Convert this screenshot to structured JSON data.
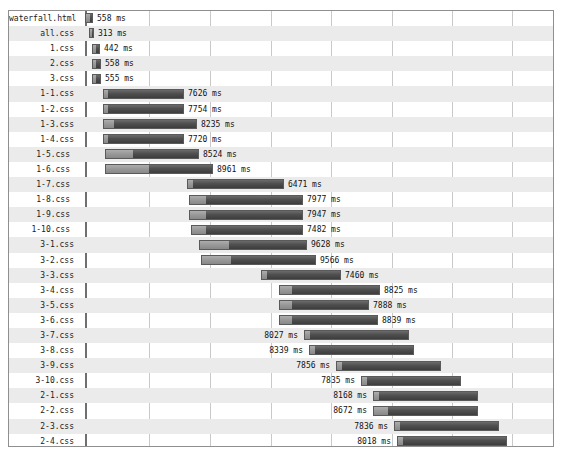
{
  "chart_data": {
    "type": "bar",
    "title": "",
    "subtitle": "",
    "xlabel": "",
    "ylabel": "",
    "orientation": "horizontal",
    "style": "waterfall-timeline",
    "unit": "ms",
    "grid": true,
    "legend": null,
    "xlim": [
      0,
      10000
    ],
    "axis_start_px": 76,
    "axis_end_px": 547,
    "gridlines_px": [
      76,
      140,
      201,
      262,
      322,
      383,
      443,
      503,
      547
    ],
    "categories": [
      "waterfall.html",
      "all.css",
      "1.css",
      "2.css",
      "3.css",
      "1-1.css",
      "1-2.css",
      "1-3.css",
      "1-4.css",
      "1-5.css",
      "1-6.css",
      "1-7.css",
      "1-8.css",
      "1-9.css",
      "1-10.css",
      "3-1.css",
      "3-2.css",
      "3-3.css",
      "3-4.css",
      "3-5.css",
      "3-6.css",
      "3-7.css",
      "3-8.css",
      "3-9.css",
      "3-10.css",
      "2-1.css",
      "2-2.css",
      "2-3.css",
      "2-4.css",
      "2-5.css",
      "2-6.css",
      "2-7.css",
      "2-8.css",
      "2-9.css",
      "2-10.css"
    ],
    "values": [
      558,
      313,
      442,
      558,
      555,
      7626,
      7754,
      8235,
      7720,
      8524,
      8961,
      6471,
      7977,
      7947,
      7482,
      9628,
      9566,
      7460,
      8825,
      7888,
      8839,
      8027,
      8339,
      7856,
      7835,
      8168,
      8672,
      7836,
      8018,
      7765,
      7938,
      7478,
      7391,
      6798,
      6080
    ],
    "value_labels": [
      "558 ms",
      "313 ms",
      "442 ms",
      "558 ms",
      "555 ms",
      "7626 ms",
      "7754 ms",
      "8235 ms",
      "7720 ms",
      "8524 ms",
      "8961 ms",
      "6471 ms",
      "7977 ms",
      "7947 ms",
      "7482 ms",
      "9628 ms",
      "9566 ms",
      "7460 ms",
      "8825 ms",
      "7888 ms",
      "8839 ms",
      "8027 ms",
      "8339 ms",
      "7856 ms",
      "7835 ms",
      "8168 ms",
      "8672 ms",
      "7836 ms",
      "8018 ms",
      "7765 ms",
      "7938 ms",
      "7478 ms",
      "7391 ms",
      "6798 ms",
      "6080 ms"
    ]
  },
  "rows": [
    {
      "label": "waterfall.html",
      "value": "558 ms",
      "start": 76,
      "wait": 4,
      "width": 8,
      "label_side": "after",
      "indent": false
    },
    {
      "label": "all.css",
      "value": "313 ms",
      "start": 80,
      "wait": 2,
      "width": 5,
      "label_side": "after",
      "indent": false
    },
    {
      "label": "1.css",
      "value": "442 ms",
      "start": 83,
      "wait": 3,
      "width": 8,
      "label_side": "after",
      "indent": false
    },
    {
      "label": "2.css",
      "value": "558 ms",
      "start": 83,
      "wait": 3,
      "width": 9,
      "label_side": "after",
      "indent": false
    },
    {
      "label": "3.css",
      "value": "555 ms",
      "start": 83,
      "wait": 3,
      "width": 9,
      "label_side": "after",
      "indent": false
    },
    {
      "label": "1-1.css",
      "value": "7626 ms",
      "start": 94,
      "wait": 4,
      "width": 81,
      "label_side": "after",
      "indent": false
    },
    {
      "label": "1-2.css",
      "value": "7754 ms",
      "start": 94,
      "wait": 4,
      "width": 81,
      "label_side": "after",
      "indent": false
    },
    {
      "label": "1-3.css",
      "value": "8235 ms",
      "start": 94,
      "wait": 10,
      "width": 94,
      "label_side": "after",
      "indent": false
    },
    {
      "label": "1-4.css",
      "value": "7720 ms",
      "start": 94,
      "wait": 4,
      "width": 81,
      "label_side": "after",
      "indent": false
    },
    {
      "label": "1-5.css",
      "value": "8524 ms",
      "start": 96,
      "wait": 27,
      "width": 94,
      "label_side": "after",
      "indent": true
    },
    {
      "label": "1-6.css",
      "value": "8961 ms",
      "start": 96,
      "wait": 43,
      "width": 108,
      "label_side": "after",
      "indent": true
    },
    {
      "label": "1-7.css",
      "value": "6471 ms",
      "start": 178,
      "wait": 5,
      "width": 97,
      "label_side": "after",
      "indent": true
    },
    {
      "label": "1-8.css",
      "value": "7977 ms",
      "start": 180,
      "wait": 16,
      "width": 114,
      "label_side": "after",
      "indent": true
    },
    {
      "label": "1-9.css",
      "value": "7947 ms",
      "start": 180,
      "wait": 16,
      "width": 114,
      "label_side": "after",
      "indent": true
    },
    {
      "label": "1-10.css",
      "value": "7482 ms",
      "start": 182,
      "wait": 14,
      "width": 112,
      "label_side": "after",
      "indent": true
    },
    {
      "label": "3-1.css",
      "value": "9628 ms",
      "start": 190,
      "wait": 29,
      "width": 108,
      "label_side": "after",
      "indent": false
    },
    {
      "label": "3-2.css",
      "value": "9566 ms",
      "start": 192,
      "wait": 29,
      "width": 115,
      "label_side": "after",
      "indent": false
    },
    {
      "label": "3-3.css",
      "value": "7460 ms",
      "start": 252,
      "wait": 5,
      "width": 80,
      "label_side": "after",
      "indent": false
    },
    {
      "label": "3-4.css",
      "value": "8825 ms",
      "start": 270,
      "wait": 12,
      "width": 101,
      "label_side": "after",
      "indent": false
    },
    {
      "label": "3-5.css",
      "value": "7888 ms",
      "start": 270,
      "wait": 12,
      "width": 90,
      "label_side": "after",
      "indent": false
    },
    {
      "label": "3-6.css",
      "value": "8839 ms",
      "start": 270,
      "wait": 12,
      "width": 99,
      "label_side": "after",
      "indent": false
    },
    {
      "label": "3-7.css",
      "value": "8027 ms",
      "start": 295,
      "wait": 5,
      "width": 105,
      "label_side": "before",
      "indent": false
    },
    {
      "label": "3-8.css",
      "value": "8339 ms",
      "start": 300,
      "wait": 5,
      "width": 105,
      "label_side": "before",
      "indent": false
    },
    {
      "label": "3-9.css",
      "value": "7856 ms",
      "start": 327,
      "wait": 5,
      "width": 105,
      "label_side": "before",
      "indent": false
    },
    {
      "label": "3-10.css",
      "value": "7835 ms",
      "start": 352,
      "wait": 5,
      "width": 100,
      "label_side": "before",
      "indent": false
    },
    {
      "label": "2-1.css",
      "value": "8168 ms",
      "start": 364,
      "wait": 5,
      "width": 105,
      "label_side": "before",
      "indent": false
    },
    {
      "label": "2-2.css",
      "value": "8672 ms",
      "start": 364,
      "wait": 14,
      "width": 105,
      "label_side": "before",
      "indent": false
    },
    {
      "label": "2-3.css",
      "value": "7836 ms",
      "start": 385,
      "wait": 5,
      "width": 105,
      "label_side": "before",
      "indent": false
    },
    {
      "label": "2-4.css",
      "value": "8018 ms",
      "start": 388,
      "wait": 5,
      "width": 110,
      "label_side": "before",
      "indent": false
    },
    {
      "label": "2-5.css",
      "value": "7765 ms",
      "start": 408,
      "wait": 5,
      "width": 105,
      "label_side": "before",
      "indent": false
    },
    {
      "label": "2-6.css",
      "value": "7938 ms",
      "start": 415,
      "wait": 5,
      "width": 100,
      "label_side": "before",
      "indent": false
    },
    {
      "label": "2-7.css",
      "value": "7478 ms",
      "start": 428,
      "wait": 5,
      "width": 97,
      "label_side": "before",
      "indent": false
    },
    {
      "label": "2-8.css",
      "value": "7391 ms",
      "start": 436,
      "wait": 5,
      "width": 97,
      "label_side": "before",
      "indent": false
    },
    {
      "label": "2-9.css",
      "value": "6798 ms",
      "start": 450,
      "wait": 5,
      "width": 90,
      "label_side": "before",
      "indent": false
    },
    {
      "label": "2-10.css",
      "value": "6080 ms",
      "start": 462,
      "wait": 5,
      "width": 80,
      "label_side": "before",
      "indent": false
    }
  ]
}
